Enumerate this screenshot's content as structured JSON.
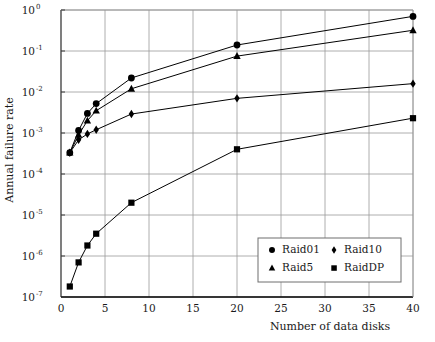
{
  "chart_data": {
    "type": "line",
    "title": "",
    "xlabel": "Number of data disks",
    "ylabel": "Annual failure rate",
    "xlim": [
      0,
      40
    ],
    "ylim": [
      1e-07,
      1
    ],
    "yscale": "log",
    "xscale": "linear",
    "grid": true,
    "legend_position": "lower-right-inside",
    "xticks": [
      0,
      5,
      10,
      15,
      20,
      25,
      30,
      35,
      40
    ],
    "xtick_labels": [
      "0",
      "5",
      "10",
      "15",
      "20",
      "25",
      "30",
      "35",
      "40"
    ],
    "yticks": [
      1,
      0.1,
      0.01,
      0.001,
      0.0001,
      1e-05,
      1e-06,
      1e-07
    ],
    "ytick_labels": [
      "10",
      "10",
      "10",
      "10",
      "10",
      "10",
      "10",
      "10"
    ],
    "ytick_exponents": [
      "0",
      "-1",
      "-2",
      "-3",
      "-4",
      "-5",
      "-6",
      "-7"
    ],
    "series": [
      {
        "name": "Raid01",
        "marker": "circle",
        "x": [
          1,
          2,
          3,
          4,
          8,
          20,
          40
        ],
        "y": [
          0.00033,
          0.00115,
          0.003,
          0.0052,
          0.022,
          0.14,
          0.7
        ]
      },
      {
        "name": "Raid5",
        "marker": "triangle",
        "x": [
          1,
          2,
          3,
          4,
          8,
          20,
          40
        ],
        "y": [
          0.00033,
          0.0009,
          0.002,
          0.0035,
          0.012,
          0.075,
          0.32
        ]
      },
      {
        "name": "Raid10",
        "marker": "diamond",
        "x": [
          1,
          2,
          3,
          4,
          8,
          20,
          40
        ],
        "y": [
          0.00033,
          0.00068,
          0.00095,
          0.0012,
          0.0029,
          0.007,
          0.016
        ]
      },
      {
        "name": "RaidDP",
        "marker": "square",
        "x": [
          1,
          2,
          3,
          4,
          8,
          20,
          40
        ],
        "y": [
          1.8e-07,
          7e-07,
          1.8e-06,
          3.5e-06,
          2e-05,
          0.0004,
          0.0023
        ]
      }
    ],
    "legend": [
      {
        "label": "Raid01",
        "marker": "circle"
      },
      {
        "label": "Raid10",
        "marker": "diamond"
      },
      {
        "label": "Raid5",
        "marker": "triangle"
      },
      {
        "label": "RaidDP",
        "marker": "square"
      }
    ],
    "colors": {
      "line": "#000000",
      "marker": "#000000",
      "grid": "#9a9a9a",
      "axis": "#3a3a3a",
      "background": "#ffffff"
    }
  }
}
